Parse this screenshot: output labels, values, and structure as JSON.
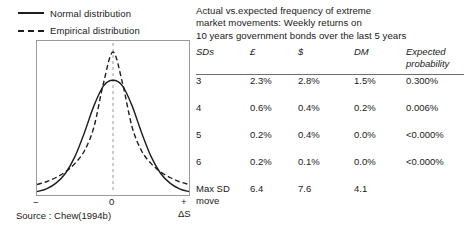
{
  "legend": {
    "items": [
      {
        "label": "Normal distribution",
        "style": "solid",
        "icon": "solid-line-icon"
      },
      {
        "label": "Empirical distribution",
        "style": "dashed",
        "icon": "dashed-line-icon"
      }
    ]
  },
  "axis": {
    "left_label": "−",
    "center_label": "0",
    "right_label": "+",
    "variable_label": "ΔS"
  },
  "source": "Source : Chew(1994b)",
  "table": {
    "title_lines": [
      "Actual vs.expected frequency of extreme",
      "market movements: Weekly returns on",
      "10 years government bonds over the last 5 years"
    ],
    "headers": [
      "SDs",
      "£",
      "$",
      "DM",
      "Expected probability"
    ],
    "header_expected_line1": "Expected",
    "header_expected_line2": "probability",
    "rows": [
      {
        "sd": "3",
        "gbp": "2.3%",
        "usd": "2.8%",
        "dm": "1.5%",
        "expected": "0.300%"
      },
      {
        "sd": "4",
        "gbp": "0.6%",
        "usd": "0.4%",
        "dm": "0.2%",
        "expected": "0.006%"
      },
      {
        "sd": "5",
        "gbp": "0.2%",
        "usd": "0.4%",
        "dm": "0.0%",
        "expected": "<0.000%"
      },
      {
        "sd": "6",
        "gbp": "0.2%",
        "usd": "0.1%",
        "dm": "0.0%",
        "expected": "<0.000%"
      }
    ],
    "max_row": {
      "label_line1": "Max SD",
      "label_line2": "move",
      "gbp": "6.4",
      "usd": "7.6",
      "dm": "4.1",
      "expected": ""
    }
  },
  "chart_data": {
    "type": "line",
    "title": "",
    "xlabel": "ΔS",
    "ylabel": "",
    "grid": false,
    "legend_position": "above-left",
    "xlim": [
      -4,
      4
    ],
    "ylim": [
      0,
      1.05
    ],
    "annotations": [
      "dashed vertical reference line at x = 0"
    ],
    "series": [
      {
        "name": "Normal distribution",
        "style": "solid",
        "color": "#1d1d1d",
        "x": [
          -4,
          -3.5,
          -3,
          -2.5,
          -2,
          -1.5,
          -1,
          -0.5,
          0,
          0.5,
          1,
          1.5,
          2,
          2.5,
          3,
          3.5,
          4
        ],
        "y": [
          0.01,
          0.03,
          0.07,
          0.14,
          0.26,
          0.43,
          0.62,
          0.76,
          0.8,
          0.76,
          0.62,
          0.43,
          0.26,
          0.14,
          0.07,
          0.03,
          0.01
        ]
      },
      {
        "name": "Empirical distribution",
        "style": "dashed",
        "color": "#1d1d1d",
        "x": [
          -4,
          -3.5,
          -3,
          -2.5,
          -2,
          -1.5,
          -1,
          -0.5,
          0,
          0.5,
          1,
          1.5,
          2,
          2.5,
          3,
          3.5,
          4
        ],
        "y": [
          0.06,
          0.08,
          0.11,
          0.15,
          0.21,
          0.3,
          0.47,
          0.78,
          1.0,
          0.78,
          0.47,
          0.3,
          0.21,
          0.15,
          0.11,
          0.08,
          0.06
        ]
      }
    ]
  },
  "colors": {
    "ink": "#1a1a1a",
    "curve": "#1d1d1d",
    "frame": "#9a9a9a",
    "rule": "#6e6e6e"
  }
}
